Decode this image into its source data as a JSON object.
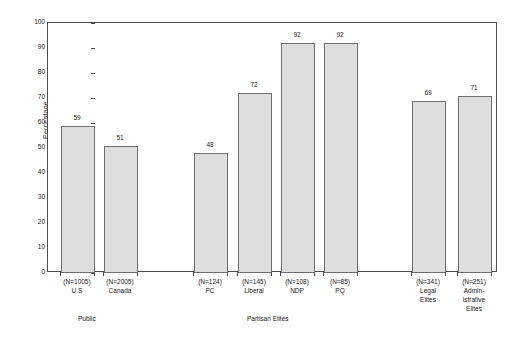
{
  "chart_data": {
    "type": "bar",
    "title": "",
    "xlabel": "",
    "ylabel": "Percentage",
    "ylim": [
      0,
      100
    ],
    "ytick_step": 10,
    "yticks": [
      0,
      10,
      20,
      30,
      40,
      50,
      60,
      70,
      80,
      90,
      100
    ],
    "grid": false,
    "legend": "none",
    "categories": [
      "U.S",
      "Canada",
      "PC",
      "Liberal",
      "NDP",
      "PQ",
      "Legal Elites",
      "Administrative Elites"
    ],
    "category_label_lines": [
      [
        "(N=1005)",
        "U.S"
      ],
      [
        "(N=2005)",
        "Canada"
      ],
      [
        "(N=124)",
        "PC"
      ],
      [
        "(N=145)",
        "Liberal"
      ],
      [
        "(N=108)",
        "NDP"
      ],
      [
        "(N=85)",
        "PQ"
      ],
      [
        "(N=341)",
        "Legal",
        "Elites"
      ],
      [
        "(N=251)",
        "Admin-",
        "istrative",
        "Elites"
      ]
    ],
    "sample_sizes": [
      1005,
      2005,
      124,
      145,
      108,
      85,
      341,
      251
    ],
    "values": [
      59,
      51,
      48,
      72,
      92,
      92,
      69,
      71
    ],
    "groups": [
      {
        "label": "Public",
        "members": [
          "U.S",
          "Canada"
        ]
      },
      {
        "label": "Partisan Elites",
        "members": [
          "PC",
          "Liberal",
          "NDP",
          "PQ"
        ]
      },
      {
        "label": "",
        "members": [
          "Legal Elites",
          "Administrative Elites"
        ]
      }
    ],
    "colors": {
      "bar_fill": "#dedede",
      "bar_stroke": "#6e6e6e",
      "axis": "#4d4d4d",
      "text": "#1a1a1a",
      "background": "#ffffff"
    }
  }
}
